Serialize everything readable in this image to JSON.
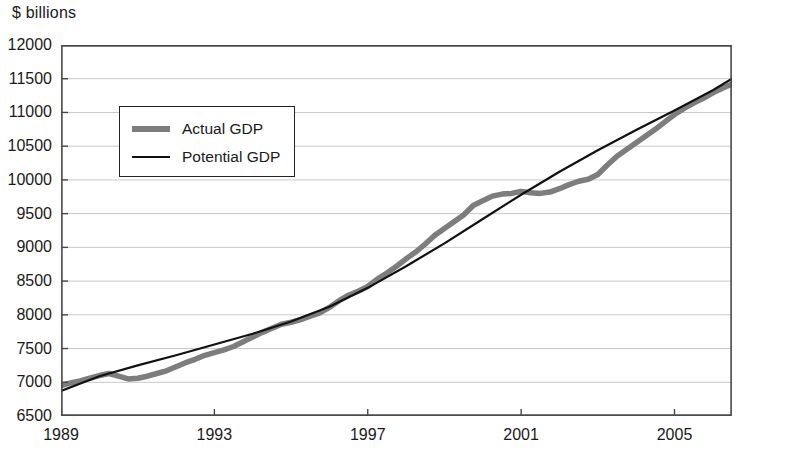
{
  "chart_data": {
    "type": "line",
    "title": "",
    "subtitle": "",
    "xlabel": "",
    "ylabel": "$ billions",
    "ylim": [
      6500,
      12000
    ],
    "xlim": [
      1989,
      2006.5
    ],
    "grid": true,
    "grid_axis": "y",
    "legend_position": "upper-left-inside",
    "y_ticks": [
      12000,
      11500,
      11000,
      10500,
      10000,
      9500,
      9000,
      8500,
      8000,
      7500,
      7000,
      6500
    ],
    "y_tick_labels": [
      "12000",
      "11500",
      "11000",
      "10500",
      "10000",
      "9500",
      "9000",
      "8500",
      "8000",
      "7500",
      "7000",
      "6500"
    ],
    "x_ticks": [
      1989,
      1993,
      1997,
      2001,
      2005
    ],
    "x_tick_labels": [
      "1989",
      "1993",
      "1997",
      "2001",
      "2005"
    ],
    "series": [
      {
        "name": "Actual GDP",
        "color": "#7d7d7d",
        "line_width": 5.5,
        "x": [
          1989.0,
          1989.25,
          1989.5,
          1989.75,
          1990.0,
          1990.25,
          1990.5,
          1990.75,
          1991.0,
          1991.25,
          1991.5,
          1991.75,
          1992.0,
          1992.25,
          1992.5,
          1992.75,
          1993.0,
          1993.25,
          1993.5,
          1993.75,
          1994.0,
          1994.25,
          1994.5,
          1994.75,
          1995.0,
          1995.25,
          1995.5,
          1995.75,
          1996.0,
          1996.25,
          1996.5,
          1996.75,
          1997.0,
          1997.25,
          1997.5,
          1997.75,
          1998.0,
          1998.25,
          1998.5,
          1998.75,
          1999.0,
          1999.25,
          1999.5,
          1999.75,
          2000.0,
          2000.25,
          2000.5,
          2000.75,
          2001.0,
          2001.25,
          2001.5,
          2001.75,
          2002.0,
          2002.25,
          2002.5,
          2002.75,
          2003.0,
          2003.25,
          2003.5,
          2003.75,
          2004.0,
          2004.25,
          2004.5,
          2004.75,
          2005.0,
          2005.25,
          2005.5,
          2005.75,
          2006.0,
          2006.25,
          2006.5
        ],
        "values": [
          6950,
          6990,
          7020,
          7060,
          7100,
          7130,
          7090,
          7050,
          7060,
          7090,
          7130,
          7170,
          7230,
          7290,
          7340,
          7400,
          7440,
          7480,
          7530,
          7600,
          7670,
          7740,
          7800,
          7860,
          7890,
          7930,
          7980,
          8030,
          8110,
          8210,
          8290,
          8350,
          8420,
          8530,
          8620,
          8720,
          8830,
          8930,
          9050,
          9180,
          9280,
          9380,
          9480,
          9620,
          9690,
          9760,
          9790,
          9800,
          9830,
          9810,
          9800,
          9820,
          9870,
          9930,
          9980,
          10010,
          10080,
          10220,
          10350,
          10450,
          10550,
          10650,
          10750,
          10860,
          10970,
          11060,
          11140,
          11210,
          11290,
          11360,
          11420
        ]
      },
      {
        "name": "Potential GDP",
        "color": "#111111",
        "line_width": 2.2,
        "x": [
          1989.0,
          1990.0,
          1991.0,
          1992.0,
          1993.0,
          1994.0,
          1995.0,
          1996.0,
          1997.0,
          1998.0,
          1999.0,
          2000.0,
          2001.0,
          2002.0,
          2003.0,
          2004.0,
          2005.0,
          2006.0,
          2006.5
        ],
        "values": [
          6870,
          7090,
          7250,
          7400,
          7560,
          7720,
          7900,
          8120,
          8400,
          8720,
          9060,
          9420,
          9780,
          10120,
          10440,
          10740,
          11030,
          11330,
          11500
        ]
      }
    ],
    "annotations": []
  },
  "legend": {
    "items": [
      {
        "label": "Actual GDP",
        "swatch": "thick-gray-line"
      },
      {
        "label": "Potential GDP",
        "swatch": "thin-black-line"
      }
    ]
  },
  "axis_unit_caption": "$ billions"
}
